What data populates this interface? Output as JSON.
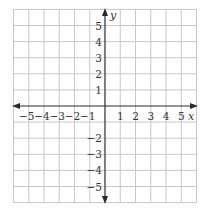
{
  "chart_data": {
    "type": "coordinate-grid",
    "title": "",
    "xlabel": "x",
    "ylabel": "y",
    "xlim": [
      -6,
      6
    ],
    "ylim": [
      -6,
      6
    ],
    "grid": true,
    "x_tick_labels": [
      "−5",
      "−4",
      "−3",
      "−2",
      "−1",
      "1",
      "2",
      "3",
      "4",
      "5"
    ],
    "x_tick_values": [
      -5,
      -4,
      -3,
      -2,
      -1,
      1,
      2,
      3,
      4,
      5
    ],
    "y_tick_labels": [
      "5",
      "4",
      "3",
      "2",
      "1",
      "−2",
      "−3",
      "−4",
      "−5"
    ],
    "y_tick_values": [
      5,
      4,
      3,
      2,
      1,
      -2,
      -3,
      -4,
      -5
    ],
    "series": []
  },
  "colors": {
    "grid": "#c8c8c8",
    "axis": "#2a2a2a",
    "text": "#333333"
  }
}
